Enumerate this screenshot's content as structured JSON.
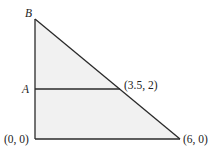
{
  "diagram": {
    "type": "geometry-triangle",
    "fill_color": "#f1f1f1",
    "stroke_color": "#2a2a2a",
    "labels": {
      "vertex_top": "B",
      "point_left": "A",
      "intersection": "(3.5, 2)",
      "origin": "(0, 0)",
      "right_vertex": "(6, 0)"
    },
    "points": {
      "origin": [
        0,
        0
      ],
      "right_vertex": [
        6,
        0
      ],
      "intersection": [
        3.5,
        2
      ]
    }
  }
}
